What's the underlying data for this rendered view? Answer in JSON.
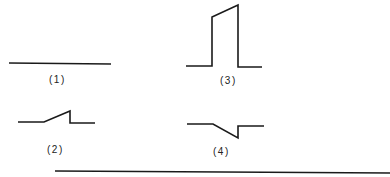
{
  "figures": [
    {
      "id": "1",
      "label": "(1)",
      "description": "flat horizontal line"
    },
    {
      "id": "2",
      "label": "(2)",
      "description": "line with small upward ramp then vertical drop"
    },
    {
      "id": "3",
      "label": "(3)",
      "description": "rectangular pulse with sloped top"
    },
    {
      "id": "4",
      "label": "(4)",
      "description": "line with downward ramp then vertical rise"
    }
  ],
  "colors": {
    "stroke": "#1a1a1a",
    "background": "#ffffff"
  }
}
